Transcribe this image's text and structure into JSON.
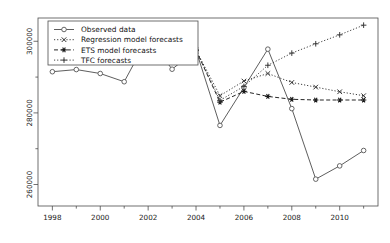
{
  "chart_data": {
    "type": "line",
    "title": "",
    "xlabel": "",
    "ylabel": "",
    "xlim": [
      1997.4,
      2011.6
    ],
    "ylim": [
      254000,
      306500
    ],
    "grid": false,
    "legend_position": "top-left",
    "xticks": [
      1998,
      2000,
      2002,
      2004,
      2006,
      2008,
      2010
    ],
    "xticklabels": [
      "1998",
      "2000",
      "2002",
      "2004",
      "2006",
      "2008",
      "2010"
    ],
    "xminorticks": [
      1999,
      2001,
      2003,
      2005,
      2007,
      2009,
      2011
    ],
    "yticks": [
      260000,
      280000,
      300000
    ],
    "yticklabels": [
      "260000",
      "280000",
      "300000"
    ],
    "yminorticks": [
      270000,
      290000
    ],
    "series": [
      {
        "name": "Observed data",
        "marker": "circle",
        "linestyle": "solid",
        "color": "#555555",
        "x": [
          1998,
          1999,
          2000,
          2001,
          2002,
          2003,
          2004,
          2005,
          2006,
          2007,
          2008,
          2009,
          2010,
          2011
        ],
        "values": [
          291500,
          292100,
          291000,
          288700,
          301100,
          292200,
          297500,
          276500,
          287100,
          297800,
          281200,
          261500,
          265200,
          269500
        ]
      },
      {
        "name": "Regression model forecasts",
        "marker": "cross-x",
        "linestyle": "dotted",
        "color": "#333333",
        "x": [
          2004,
          2005,
          2006,
          2007,
          2008,
          2009,
          2010,
          2011
        ],
        "values": [
          297500,
          284800,
          288900,
          291000,
          288500,
          287200,
          285900,
          284800
        ]
      },
      {
        "name": "ETS model forecasts",
        "marker": "asterisk",
        "linestyle": "dashed",
        "color": "#1a1a1a",
        "x": [
          2004,
          2005,
          2006,
          2007,
          2008,
          2009,
          2010,
          2011
        ],
        "values": [
          297500,
          283000,
          286000,
          284600,
          283800,
          283600,
          283600,
          283600
        ]
      },
      {
        "name": "TFC forecasts",
        "marker": "plus",
        "linestyle": "dotted",
        "color": "#3a3a3a",
        "x": [
          2004,
          2005,
          2006,
          2007,
          2008,
          2009,
          2010,
          2011
        ],
        "values": [
          297500,
          283500,
          287400,
          293300,
          296700,
          299300,
          301800,
          304500
        ]
      }
    ],
    "legend": [
      {
        "label": "Observed data",
        "marker": "circle",
        "linestyle": "solid"
      },
      {
        "label": "Regression model forecasts",
        "marker": "cross-x",
        "linestyle": "dotted"
      },
      {
        "label": "ETS model forecasts",
        "marker": "asterisk",
        "linestyle": "dashed"
      },
      {
        "label": "TFC forecasts",
        "marker": "plus",
        "linestyle": "dotted"
      }
    ]
  }
}
